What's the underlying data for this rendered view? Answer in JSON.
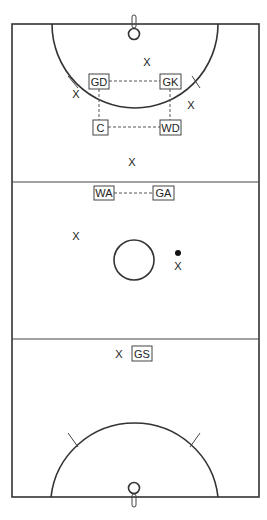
{
  "court": {
    "title": "Netball court positions diagram",
    "line_color": "#333333",
    "background": "#ffffff"
  },
  "positions": [
    {
      "id": "gd",
      "label": "GD"
    },
    {
      "id": "gk",
      "label": "GK"
    },
    {
      "id": "c",
      "label": "C"
    },
    {
      "id": "wd",
      "label": "WD"
    },
    {
      "id": "wa",
      "label": "WA"
    },
    {
      "id": "ga",
      "label": "GA"
    },
    {
      "id": "gs",
      "label": "GS"
    }
  ],
  "opponent_marks": [
    {
      "id": "x1",
      "label": "X"
    },
    {
      "id": "x2",
      "label": "X"
    },
    {
      "id": "x3",
      "label": "X"
    },
    {
      "id": "x4",
      "label": "X"
    },
    {
      "id": "x5",
      "label": "X"
    },
    {
      "id": "x6",
      "label": "X"
    },
    {
      "id": "x7",
      "label": "X"
    }
  ],
  "ball": {
    "label": "ball",
    "color": "#111111"
  }
}
